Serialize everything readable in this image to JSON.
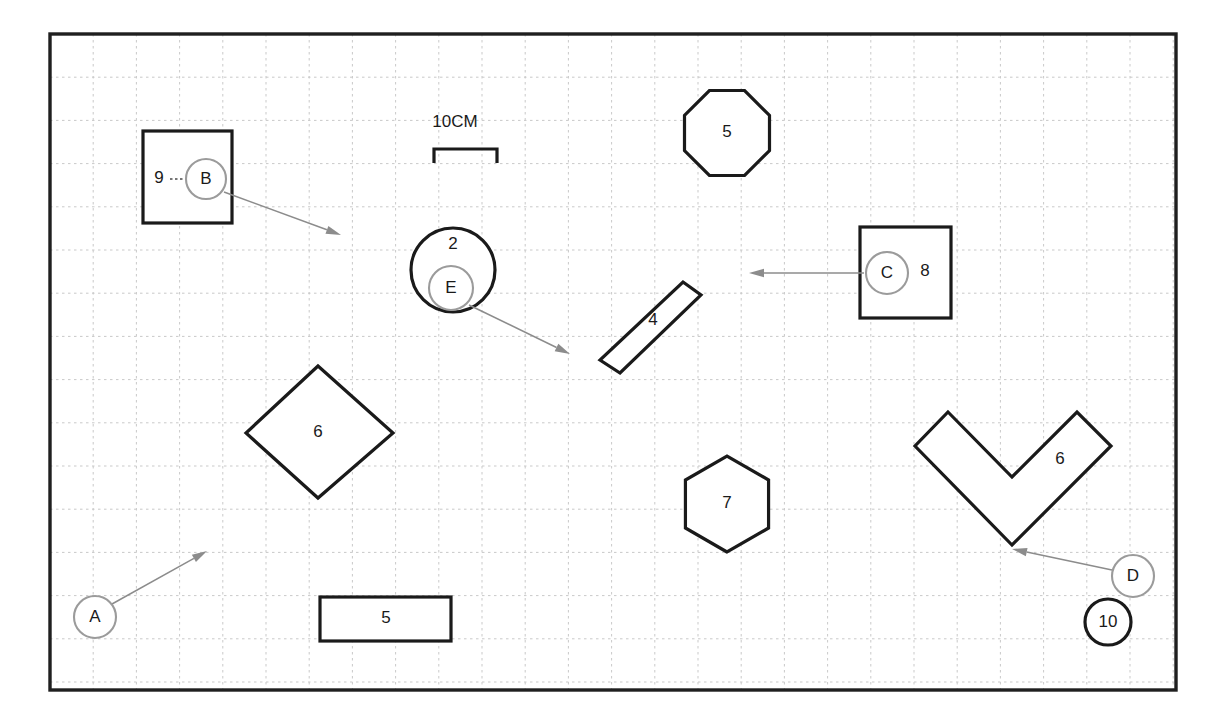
{
  "diagram": {
    "canvas": {
      "width": 1221,
      "height": 724
    },
    "frame": {
      "x": 50,
      "y": 34,
      "width": 1126,
      "height": 656,
      "stroke": "#1f1f1f"
    },
    "grid": {
      "spacing": 43.2,
      "origin_x": 50,
      "origin_y": 34,
      "color": "#c9c9c9",
      "style": "dashed"
    },
    "scale_bar": {
      "label": "10CM",
      "x1": 434,
      "x2": 497,
      "y": 149,
      "tick_height": 14,
      "text_x": 455,
      "text_y": 127
    }
  },
  "shapes": [
    {
      "id": "shape-square-9",
      "kind": "square",
      "label": "9",
      "label_x": 159,
      "label_y": 179,
      "x": 143,
      "y": 131,
      "w": 89,
      "h": 92
    },
    {
      "id": "shape-circle-2",
      "kind": "circle",
      "label": "2",
      "label_x": 453,
      "label_y": 245,
      "cx": 453,
      "cy": 270,
      "r": 42
    },
    {
      "id": "shape-octagon-5",
      "kind": "octagon",
      "label": "5",
      "label_x": 727,
      "label_y": 133,
      "cx": 727,
      "cy": 133,
      "r": 46
    },
    {
      "id": "shape-square-8",
      "kind": "square",
      "label": "8",
      "label_x": 925,
      "label_y": 272,
      "x": 860,
      "y": 227,
      "w": 91,
      "h": 91
    },
    {
      "id": "shape-rotrect-4",
      "kind": "rotated-rectangle",
      "label": "4",
      "label_x": 653,
      "label_y": 321,
      "points": "683,282 701,295 620,373 600,360"
    },
    {
      "id": "shape-diamond-6",
      "kind": "diamond",
      "label": "6",
      "label_x": 318,
      "label_y": 433,
      "points": "318,366 393,433 318,498 246,433"
    },
    {
      "id": "shape-hexagon-7",
      "kind": "hexagon",
      "label": "7",
      "label_x": 727,
      "label_y": 504,
      "cx": 727,
      "cy": 504,
      "r": 48
    },
    {
      "id": "shape-chevron-6",
      "kind": "chevron",
      "label": "6",
      "label_x": 1060,
      "label_y": 460,
      "points": "948,412 1012,477 1077,412 1111,446 1012,545 915,446"
    },
    {
      "id": "shape-rect-5",
      "kind": "rectangle",
      "label": "5",
      "label_x": 386,
      "label_y": 619,
      "x": 320,
      "y": 597,
      "w": 131,
      "h": 44
    }
  ],
  "markers": [
    {
      "id": "marker-a",
      "label": "A",
      "cx": 95,
      "cy": 617,
      "r": 21,
      "style": "light"
    },
    {
      "id": "marker-b",
      "label": "B",
      "cx": 206,
      "cy": 179,
      "r": 20,
      "style": "light"
    },
    {
      "id": "marker-c",
      "label": "C",
      "cx": 887,
      "cy": 273,
      "r": 21,
      "style": "light"
    },
    {
      "id": "marker-d",
      "label": "D",
      "cx": 1133,
      "cy": 576,
      "r": 21,
      "style": "light"
    },
    {
      "id": "marker-e",
      "label": "E",
      "cx": 451,
      "cy": 288,
      "r": 22,
      "style": "light"
    },
    {
      "id": "marker-10",
      "label": "10",
      "cx": 1108,
      "cy": 622,
      "r": 23,
      "style": "heavy"
    }
  ],
  "leaders": [
    {
      "id": "leader-a",
      "from_x": 112,
      "from_y": 604,
      "to_x": 207,
      "to_y": 551,
      "angle_deg": -29
    },
    {
      "id": "leader-b",
      "from_x": 224,
      "from_y": 192,
      "to_x": 341,
      "to_y": 235,
      "angle_deg": 20
    },
    {
      "id": "leader-c",
      "from_x": 864,
      "from_y": 273,
      "to_x": 749,
      "to_y": 273,
      "angle_deg": 180
    },
    {
      "id": "leader-d",
      "from_x": 1112,
      "from_y": 570,
      "to_x": 1012,
      "to_y": 549,
      "angle_deg": 192
    },
    {
      "id": "leader-e",
      "from_x": 469,
      "from_y": 305,
      "to_x": 570,
      "to_y": 354,
      "angle_deg": 26
    }
  ],
  "connectors": [
    {
      "id": "connector-9-b",
      "x1": 170,
      "y1": 179,
      "x2": 186,
      "y2": 179
    }
  ]
}
